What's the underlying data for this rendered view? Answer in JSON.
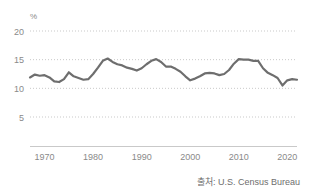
{
  "source": {
    "note": "출처: U.S. Census Bureau"
  },
  "chart_data": {
    "type": "line",
    "title": "",
    "subtitle": "",
    "xlabel": "",
    "ylabel": "",
    "yunit": "%",
    "grid": true,
    "legend": "none",
    "xlim": [
      1967,
      2022
    ],
    "ylim": [
      0,
      20
    ],
    "yticks": [
      5,
      10,
      15,
      20
    ],
    "ytick_labels": [
      "5",
      "10",
      "15",
      "20"
    ],
    "xticks": [
      1970,
      1980,
      1990,
      2000,
      2010,
      2020
    ],
    "xtick_labels": [
      "1970",
      "1980",
      "1990",
      "2000",
      "2010",
      "2020"
    ],
    "line_color": "#6e6e6e",
    "grid_color": "#c9c9c9",
    "axis_color": "#c9c9c9",
    "series": [
      {
        "name": "Poverty rate",
        "x": [
          1967,
          1968,
          1969,
          1970,
          1971,
          1972,
          1973,
          1974,
          1975,
          1976,
          1977,
          1978,
          1979,
          1980,
          1981,
          1982,
          1983,
          1984,
          1985,
          1986,
          1987,
          1988,
          1989,
          1990,
          1991,
          1992,
          1993,
          1994,
          1995,
          1996,
          1997,
          1998,
          1999,
          2000,
          2001,
          2002,
          2003,
          2004,
          2005,
          2006,
          2007,
          2008,
          2009,
          2010,
          2011,
          2012,
          2013,
          2014,
          2015,
          2016,
          2017,
          2018,
          2019,
          2020,
          2021,
          2022
        ],
        "values": [
          11.9,
          12.4,
          12.2,
          12.3,
          11.9,
          11.2,
          11.1,
          11.6,
          12.8,
          12.1,
          11.8,
          11.5,
          11.6,
          12.5,
          13.6,
          14.8,
          15.2,
          14.6,
          14.2,
          14.0,
          13.6,
          13.4,
          13.1,
          13.5,
          14.2,
          14.8,
          15.1,
          14.6,
          13.8,
          13.8,
          13.4,
          12.9,
          12.1,
          11.4,
          11.7,
          12.1,
          12.6,
          12.7,
          12.6,
          12.3,
          12.5,
          13.2,
          14.3,
          15.1,
          15.0,
          15.0,
          14.8,
          14.8,
          13.5,
          12.7,
          12.3,
          11.8,
          10.5,
          11.4,
          11.6,
          11.5
        ]
      }
    ]
  }
}
